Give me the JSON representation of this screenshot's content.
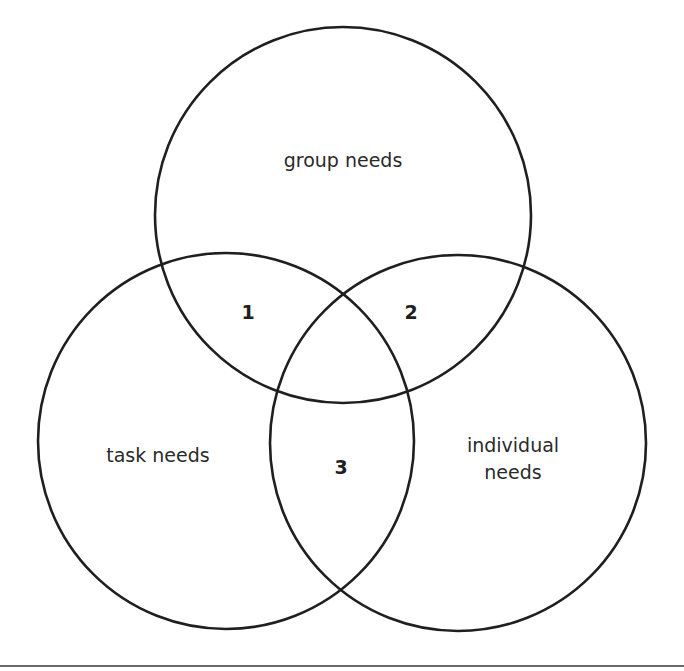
{
  "diagram": {
    "type": "venn",
    "circles": [
      {
        "id": "group",
        "label": "group needs",
        "cx": 343,
        "cy": 215,
        "r": 188
      },
      {
        "id": "task",
        "label": "task needs",
        "cx": 226,
        "cy": 441,
        "r": 188
      },
      {
        "id": "individual",
        "label_lines": [
          "individual",
          "needs"
        ],
        "cx": 458,
        "cy": 443,
        "r": 188
      }
    ],
    "labels": {
      "group": "group needs",
      "task": "task needs",
      "individual_line1": "individual",
      "individual_line2": "needs"
    },
    "intersections": {
      "task_group": "1",
      "group_individual": "2",
      "task_individual": "3"
    },
    "colors": {
      "stroke": "#1f1f1f",
      "text": "#2a2a2a",
      "rule": "#6a6a6a",
      "background": "#ffffff"
    }
  }
}
